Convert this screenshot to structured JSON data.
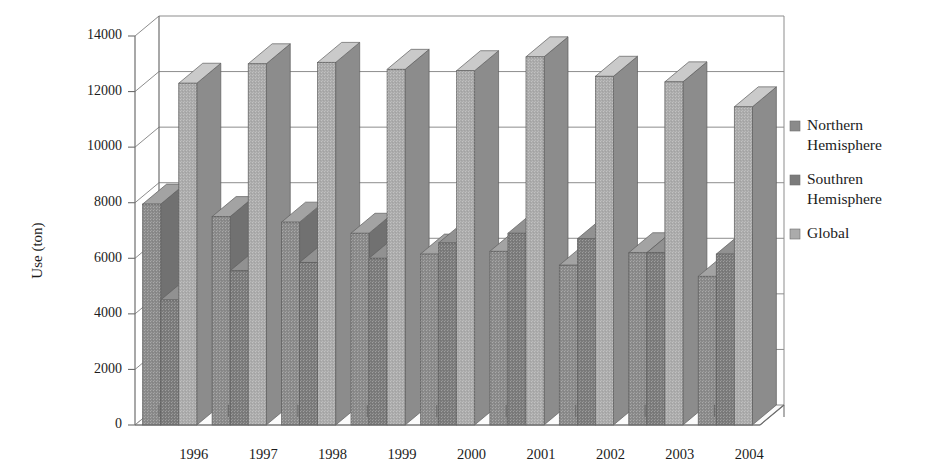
{
  "chart_data": {
    "type": "bar",
    "title": "",
    "subtitle": "",
    "xlabel": "",
    "ylabel": "Use (ton)",
    "categories": [
      "1996",
      "1997",
      "1998",
      "1999",
      "2000",
      "2001",
      "2002",
      "2003",
      "2004"
    ],
    "series": [
      {
        "name": "Northern Hemisphere",
        "color": "#8a8a8a",
        "values": [
          7950,
          7500,
          7300,
          6900,
          6150,
          6250,
          5750,
          6200,
          5350
        ]
      },
      {
        "name": "Southren Hemisphere",
        "color": "#7b7b7b",
        "values": [
          4500,
          5550,
          5850,
          6000,
          6550,
          6900,
          6700,
          6200,
          6150
        ]
      },
      {
        "name": "Global",
        "color": "#ababab",
        "values": [
          12300,
          13000,
          13050,
          12800,
          12750,
          13250,
          12550,
          12350,
          11450
        ]
      }
    ],
    "ylim": [
      0,
      14000
    ],
    "ytick_values": [
      0,
      2000,
      4000,
      6000,
      8000,
      10000,
      12000,
      14000
    ],
    "ytick_labels": [
      "0",
      "2000",
      "4000",
      "6000",
      "8000",
      "10000",
      "12000",
      "14000"
    ],
    "grid": true,
    "legend_position": "right",
    "style": "3d-column-scanned"
  },
  "legend": {
    "items": [
      {
        "label": "Northern Hemisphere",
        "swatch": "#8a8a8a"
      },
      {
        "label": "Southren Hemisphere",
        "swatch": "#7b7b7b"
      },
      {
        "label": "Global",
        "swatch": "#ababab"
      }
    ]
  },
  "colors": {
    "northern": "#8a8a8a",
    "southern": "#7b7b7b",
    "global": "#ababab",
    "grid": "#8d8d8d",
    "axis": "#6e6e6e",
    "text": "#1c1c1c",
    "background": "#ffffff"
  }
}
